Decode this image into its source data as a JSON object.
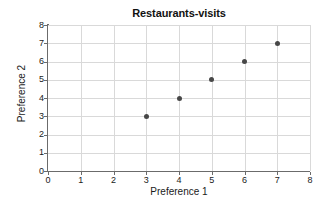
{
  "chart_data": {
    "type": "scatter",
    "title": "Restaurants-visits",
    "xlabel": "Preference 1",
    "ylabel": "Preference 2",
    "xlim": [
      0,
      8
    ],
    "ylim": [
      0,
      8
    ],
    "xticks": [
      "0",
      "1",
      "2",
      "3",
      "4",
      "5",
      "6",
      "7",
      "8"
    ],
    "yticks": [
      "0",
      "1",
      "2",
      "3",
      "4",
      "5",
      "6",
      "7",
      "8"
    ],
    "grid": true,
    "legend": false,
    "marker_color": "#474747",
    "gridline_color": "#d9d9d9",
    "axis_color": "#6b6b6b",
    "background_color": "#ffffff",
    "series": [
      {
        "name": "Restaurants-visits",
        "points": [
          {
            "x": 3,
            "y": 3
          },
          {
            "x": 4,
            "y": 4
          },
          {
            "x": 5,
            "y": 5
          },
          {
            "x": 6,
            "y": 6
          },
          {
            "x": 7,
            "y": 7
          }
        ]
      }
    ]
  }
}
